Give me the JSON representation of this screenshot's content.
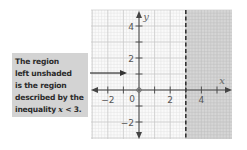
{
  "callout": {
    "lines": [
      "The region",
      "left unshaded",
      "is the region",
      "described by the",
      "inequality "
    ],
    "inequality_var": "x",
    "inequality_rest": " < 3."
  },
  "axes": {
    "x_label": "x",
    "y_label": "y",
    "origin_label": "0",
    "x_ticks": [
      {
        "value": -2,
        "label": "−2"
      },
      {
        "value": 2,
        "label": "2"
      },
      {
        "value": 4,
        "label": "4"
      }
    ],
    "y_ticks": [
      {
        "value": 4,
        "label": "4"
      },
      {
        "value": 2,
        "label": "2"
      },
      {
        "value": -2,
        "label": "−2"
      }
    ]
  },
  "colors": {
    "shade": "#cfcfcf",
    "grid_minor": "#e4e4e4",
    "grid_major": "#c8c8c8",
    "axis": "#444444",
    "boundary": "#333333",
    "callout_bg": "#d3d3d3"
  },
  "chart_data": {
    "type": "inequality-region",
    "title": "",
    "xlabel": "x",
    "ylabel": "y",
    "xlim": [
      -3,
      6
    ],
    "ylim": [
      -3,
      5
    ],
    "grid": true,
    "boundary": {
      "type": "vertical-line",
      "x": 3,
      "style": "dashed"
    },
    "shaded_region": "x >= 3",
    "unshaded_region": "x < 3",
    "inequality": "x < 3",
    "x_tick_labels": [
      -2,
      0,
      2,
      4
    ],
    "y_tick_labels": [
      4,
      2,
      -2
    ],
    "annotation": "The region left unshaded is the region described by the inequality x < 3."
  }
}
